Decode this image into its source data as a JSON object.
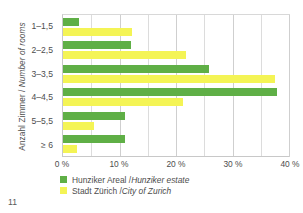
{
  "page": {
    "number": "11"
  },
  "chart_data": {
    "type": "bar",
    "orientation": "horizontal",
    "title": "",
    "xlabel": "",
    "ylabel": "Anzahl Zimmer / Number of rooms",
    "ylabel_parts": {
      "german": "Anzahl Zimmer /",
      "english": "Number of rooms"
    },
    "categories": [
      "1–1,5",
      "2–2,5",
      "3–3,5",
      "4–4,5",
      "5–5,5",
      "≥ 6"
    ],
    "series": [
      {
        "name": "Hunziker Areal / Hunziker estate",
        "name_german": "Hunziker Areal /",
        "name_english": "Hunziker estate",
        "color": "#5FAF46",
        "values": [
          2.8,
          12.0,
          25.8,
          37.8,
          11.0,
          11.0
        ]
      },
      {
        "name": "Stadt Zürich / City of Zurich",
        "name_german": "Stadt Zürich /",
        "name_english": "City of Zurich",
        "color": "#F4F455",
        "values": [
          12.2,
          21.7,
          37.5,
          21.2,
          5.5,
          2.5
        ]
      }
    ],
    "xlim": [
      0,
      40
    ],
    "xticks": [
      0,
      10,
      20,
      30,
      40
    ],
    "xtick_labels": [
      "0 %",
      "10 %",
      "20 %",
      "30 %",
      "40 %"
    ],
    "x_gridlines": [
      5,
      10,
      15,
      20,
      25,
      30,
      35,
      40
    ],
    "x_unit": "%",
    "grid": true,
    "legend_position": "bottom-left"
  }
}
